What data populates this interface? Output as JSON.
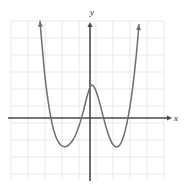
{
  "figure": {
    "kind": "cartesian-graph",
    "background_color": "#ffffff",
    "width": 184,
    "height": 190
  },
  "grid": {
    "line_color": "#e3e3e6",
    "line_width": 0.8,
    "left": 11,
    "top": 21,
    "right": 164,
    "bottom": 179,
    "cell_size": 17,
    "columns": 9,
    "rows": 9,
    "visible": true
  },
  "axes": {
    "color": "#4a4a4a",
    "line_width": 1.6,
    "x_axis": {
      "label": "x",
      "label_color": "#2b2b2b",
      "pixel_y": 118,
      "arrow": "right",
      "arrow_tip_x": 172
    },
    "y_axis": {
      "label": "y",
      "label_color": "#2b2b2b",
      "pixel_x": 90,
      "arrow": "up",
      "arrow_tip_y": 22
    }
  },
  "chart_data": {
    "type": "line",
    "title": "",
    "subtitle": "",
    "xlabel": "x",
    "ylabel": "y",
    "grid": true,
    "legend": null,
    "curve_color": "#6e6e72",
    "curve_width": 1.5,
    "xlim": [
      -4.65,
      4.35
    ],
    "ylim": [
      -3.6,
      5.7
    ],
    "features": {
      "local_maximum": {
        "x": 0.0,
        "y": 1.94
      },
      "local_minima": [
        {
          "x": -1.65,
          "y": -2.18
        },
        {
          "x": 1.59,
          "y": -2.18
        }
      ],
      "x_intercepts": [
        -2.47,
        -0.76,
        0.71,
        2.41
      ],
      "y_intercept": 1.94,
      "end_behavior_left": "up",
      "end_behavior_right": "up"
    },
    "x": [
      -2.94,
      -2.85,
      -2.76,
      -2.68,
      -2.59,
      -2.5,
      -2.41,
      -2.32,
      -2.24,
      -2.15,
      -2.06,
      -1.97,
      -1.88,
      -1.79,
      -1.71,
      -1.62,
      -1.53,
      -1.44,
      -1.35,
      -1.26,
      -1.18,
      -1.09,
      -1.0,
      -0.91,
      -0.82,
      -0.74,
      -0.65,
      -0.56,
      -0.47,
      -0.38,
      -0.29,
      -0.21,
      -0.12,
      -0.03,
      0.06,
      0.15,
      0.24,
      0.32,
      0.41,
      0.5,
      0.59,
      0.68,
      0.76,
      0.85,
      0.94,
      1.03,
      1.12,
      1.21,
      1.29,
      1.38,
      1.47,
      1.56,
      1.65,
      1.74,
      1.82,
      1.91,
      2.0,
      2.09,
      2.18,
      2.26,
      2.35,
      2.44,
      2.53,
      2.62,
      2.71,
      2.79,
      2.88
    ],
    "y": [
      5.7,
      4.6,
      3.6,
      2.72,
      1.93,
      1.24,
      0.64,
      0.13,
      -0.3,
      -0.66,
      -0.95,
      -1.19,
      -1.37,
      -1.5,
      -1.6,
      -1.66,
      -1.69,
      -1.69,
      -1.66,
      -1.6,
      -1.52,
      -1.41,
      -1.28,
      -1.12,
      -0.93,
      -0.72,
      -0.47,
      -0.2,
      0.11,
      0.44,
      0.8,
      1.13,
      1.45,
      1.74,
      1.91,
      1.93,
      1.83,
      1.66,
      1.43,
      1.14,
      0.81,
      0.46,
      0.14,
      -0.19,
      -0.52,
      -0.82,
      -1.08,
      -1.3,
      -1.46,
      -1.59,
      -1.67,
      -1.7,
      -1.68,
      -1.6,
      -1.47,
      -1.27,
      -1.0,
      -0.67,
      -0.26,
      0.16,
      0.68,
      1.27,
      1.95,
      2.72,
      3.58,
      4.44,
      5.5
    ]
  }
}
